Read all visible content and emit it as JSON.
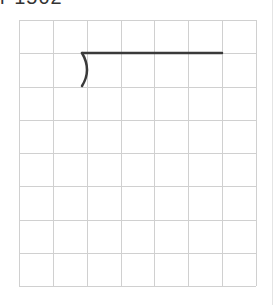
{
  "header": {
    "clipped_text": "r 1502 — · · ·"
  },
  "grid": {
    "left": 19,
    "top": 20,
    "columns": 7,
    "rows": 8,
    "cell_width": 33.86,
    "cell_height": 33.25,
    "line_color": "#d0d0d0"
  },
  "drawing": {
    "stroke_color": "#3a3a3a",
    "stroke_width": 2.5,
    "horizontal_line": {
      "x1": 82,
      "y1": 53,
      "x2": 222,
      "y2": 53
    },
    "arc": {
      "start": [
        82,
        53
      ],
      "control": [
        92,
        70
      ],
      "end": [
        82,
        86
      ]
    }
  }
}
